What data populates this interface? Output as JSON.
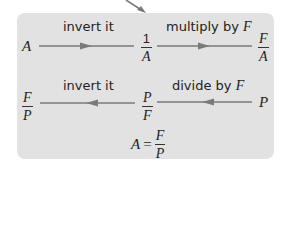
{
  "colors": {
    "box_background": "#e2e2e2",
    "arrow": "#7a7a7a",
    "text": "#222222"
  },
  "row1": {
    "start": "A",
    "step1_label": "invert it",
    "mid": {
      "numerator": "1",
      "denominator": "A"
    },
    "step2_label": "multiply by",
    "step2_var": "F",
    "end": {
      "numerator": "F",
      "denominator": "A"
    }
  },
  "row2": {
    "end": {
      "numerator": "F",
      "denominator": "P"
    },
    "step1_label": "invert it",
    "mid": {
      "numerator": "P",
      "denominator": "F"
    },
    "step2_label": "divide by",
    "step2_var": "F",
    "start": "P"
  },
  "result": {
    "lhs": "A",
    "op": "=",
    "numerator": "F",
    "denominator": "P"
  }
}
